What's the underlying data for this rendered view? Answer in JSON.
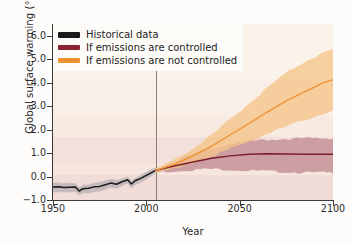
{
  "chart_data": {
    "type": "line",
    "title": "",
    "xlabel": "Year",
    "ylabel": "Global surface warming (°C)",
    "xlim": [
      1950,
      2100
    ],
    "ylim": [
      -1.0,
      6.5
    ],
    "xticks": [
      1950,
      2000,
      2050,
      2100
    ],
    "xtick_labels": [
      "1950",
      "2000",
      "2050",
      "2100"
    ],
    "yticks": [
      -1.0,
      0.0,
      1.0,
      2.0,
      3.0,
      4.0,
      5.0,
      6.0
    ],
    "ytick_labels": [
      "−1.0",
      "0.0",
      "1.0",
      "2.0",
      "3.0",
      "4.0",
      "5.0",
      "6.0"
    ],
    "grid": false,
    "legend_position": "upper left",
    "annotations": [
      {
        "type": "vline",
        "x": 2005,
        "label": "present day divider",
        "color": "#8a7f78"
      }
    ],
    "series": [
      {
        "name": "Historical data",
        "color": "#1a1a1a",
        "band_color": "#a9a6ab",
        "x": [
          1950,
          1953,
          1956,
          1959,
          1962,
          1964,
          1966,
          1969,
          1972,
          1975,
          1978,
          1981,
          1984,
          1987,
          1990,
          1992,
          1994,
          1997,
          2000,
          2003,
          2005
        ],
        "values": [
          -0.45,
          -0.44,
          -0.47,
          -0.46,
          -0.45,
          -0.62,
          -0.52,
          -0.5,
          -0.44,
          -0.42,
          -0.35,
          -0.28,
          -0.33,
          -0.22,
          -0.14,
          -0.32,
          -0.18,
          -0.08,
          0.05,
          0.18,
          0.26
        ],
        "band_lower": [
          -0.66,
          -0.64,
          -0.68,
          -0.67,
          -0.66,
          -0.8,
          -0.72,
          -0.69,
          -0.63,
          -0.61,
          -0.54,
          -0.47,
          -0.52,
          -0.4,
          -0.31,
          -0.49,
          -0.35,
          -0.24,
          -0.1,
          0.03,
          0.12
        ],
        "band_upper": [
          -0.26,
          -0.25,
          -0.28,
          -0.27,
          -0.26,
          -0.44,
          -0.34,
          -0.32,
          -0.26,
          -0.24,
          -0.17,
          -0.1,
          -0.15,
          -0.05,
          0.02,
          -0.15,
          -0.02,
          0.07,
          0.2,
          0.33,
          0.4
        ]
      },
      {
        "name": "If emissions are controlled",
        "color": "#7a1f2b",
        "band_color": "#c08b92",
        "x": [
          2005,
          2015,
          2025,
          2035,
          2045,
          2055,
          2065,
          2075,
          2085,
          2095,
          2100
        ],
        "values": [
          0.26,
          0.45,
          0.62,
          0.78,
          0.88,
          0.95,
          0.97,
          0.96,
          0.95,
          0.95,
          0.95
        ],
        "band_lower": [
          0.2,
          0.26,
          0.32,
          0.35,
          0.32,
          0.28,
          0.25,
          0.22,
          0.2,
          0.19,
          0.19
        ],
        "band_upper": [
          0.33,
          0.68,
          0.98,
          1.25,
          1.42,
          1.54,
          1.6,
          1.63,
          1.65,
          1.66,
          1.66
        ]
      },
      {
        "name": "If emissions are not controlled",
        "color": "#f0912f",
        "band_color": "#f5c489",
        "x": [
          2005,
          2015,
          2025,
          2035,
          2045,
          2055,
          2065,
          2075,
          2085,
          2095,
          2100
        ],
        "values": [
          0.26,
          0.52,
          0.88,
          1.3,
          1.78,
          2.26,
          2.76,
          3.22,
          3.62,
          4.0,
          4.12
        ],
        "band_lower": [
          0.2,
          0.34,
          0.6,
          0.88,
          1.2,
          1.52,
          1.86,
          2.16,
          2.45,
          2.72,
          2.82
        ],
        "band_upper": [
          0.33,
          0.74,
          1.22,
          1.8,
          2.46,
          3.14,
          3.82,
          4.44,
          4.94,
          5.3,
          5.42
        ]
      }
    ],
    "legend": [
      {
        "label": "Historical data",
        "color": "#1a1a1a"
      },
      {
        "label": "If emissions are controlled",
        "color": "#8b2430"
      },
      {
        "label": "If emissions are not controlled",
        "color": "#f0912f"
      }
    ],
    "background_color": "#f8efe6",
    "figure_background": "#fdfcfb"
  }
}
